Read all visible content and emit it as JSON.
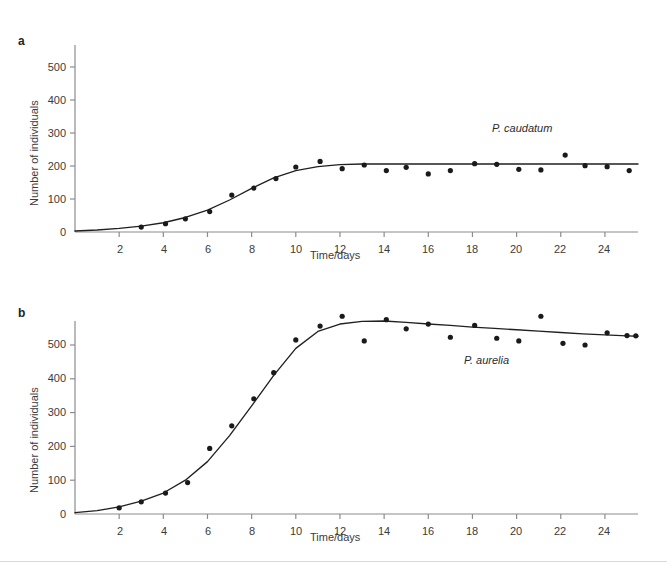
{
  "figure": {
    "panels": [
      {
        "key": "a",
        "label": "a",
        "series_label": "P. caudatum"
      },
      {
        "key": "b",
        "label": "b",
        "series_label": "P. aurelia"
      }
    ]
  },
  "chart_data": [
    {
      "type": "scatter",
      "panel": "a",
      "title": "",
      "series_label": "P. caudatum",
      "xlabel": "Time/days",
      "ylabel": "Number of individuals",
      "xlim": [
        0,
        25.5
      ],
      "ylim": [
        0,
        560
      ],
      "xticks": [
        2,
        4,
        6,
        8,
        10,
        12,
        14,
        16,
        18,
        20,
        22,
        24
      ],
      "yticks": [
        0,
        100,
        200,
        300,
        400,
        500
      ],
      "grid": false,
      "legend": "none",
      "x": [
        3.0,
        4.1,
        5.0,
        6.1,
        7.1,
        8.1,
        9.1,
        10.0,
        11.1,
        12.1,
        13.1,
        14.1,
        15.0,
        16.0,
        17.0,
        18.1,
        19.1,
        20.1,
        21.1,
        22.2,
        23.1,
        24.1,
        25.1
      ],
      "values": [
        15,
        25,
        40,
        62,
        112,
        133,
        162,
        197,
        214,
        192,
        203,
        186,
        196,
        176,
        186,
        207,
        205,
        190,
        188,
        233,
        201,
        198,
        186
      ],
      "series": [
        {
          "name": "P. caudatum observed counts",
          "x": [
            3.0,
            4.1,
            5.0,
            6.1,
            7.1,
            8.1,
            9.1,
            10.0,
            11.1,
            12.1,
            13.1,
            14.1,
            15.0,
            16.0,
            17.0,
            18.1,
            19.1,
            20.1,
            21.1,
            22.2,
            23.1,
            24.1,
            25.1
          ],
          "values": [
            15,
            25,
            40,
            62,
            112,
            133,
            162,
            197,
            214,
            192,
            203,
            186,
            196,
            176,
            186,
            207,
            205,
            190,
            188,
            233,
            201,
            198,
            186
          ]
        },
        {
          "name": "P. caudatum logistic fit",
          "x": [
            0,
            1,
            2,
            3,
            4,
            5,
            6,
            7,
            8,
            9,
            10,
            11,
            12,
            13,
            14,
            15,
            16,
            17,
            18,
            19,
            20,
            21,
            22,
            23,
            24,
            25,
            25.5
          ],
          "values": [
            3,
            6,
            11,
            18,
            28,
            44,
            66,
            97,
            132,
            164,
            186,
            198,
            204,
            206,
            206,
            206,
            206,
            206,
            206,
            206,
            206,
            206,
            206,
            206,
            206,
            206,
            206
          ]
        }
      ]
    },
    {
      "type": "scatter",
      "panel": "b",
      "title": "",
      "series_label": "P. aurelia",
      "xlabel": "Time/days",
      "ylabel": "Number of individuals",
      "xlim": [
        0,
        25.5
      ],
      "ylim": [
        0,
        560
      ],
      "xticks": [
        2,
        4,
        6,
        8,
        10,
        12,
        14,
        16,
        18,
        20,
        22,
        24
      ],
      "yticks": [
        0,
        100,
        200,
        300,
        400,
        500
      ],
      "grid": false,
      "legend": "none",
      "x": [
        2.0,
        3.0,
        4.1,
        5.1,
        6.1,
        7.1,
        8.1,
        9.0,
        10.0,
        11.1,
        12.1,
        13.1,
        14.1,
        15.0,
        16.0,
        17.0,
        18.1,
        19.1,
        20.1,
        21.1,
        22.1,
        23.1,
        24.1,
        25.0,
        25.4
      ],
      "values": [
        18,
        36,
        62,
        93,
        194,
        261,
        341,
        418,
        515,
        556,
        585,
        512,
        575,
        548,
        562,
        523,
        558,
        520,
        512,
        585,
        505,
        500,
        536,
        528,
        527
      ],
      "series": [
        {
          "name": "P. aurelia observed counts",
          "x": [
            2.0,
            3.0,
            4.1,
            5.1,
            6.1,
            7.1,
            8.1,
            9.0,
            10.0,
            11.1,
            12.1,
            13.1,
            14.1,
            15.0,
            16.0,
            17.0,
            18.1,
            19.1,
            20.1,
            21.1,
            22.1,
            23.1,
            24.1,
            25.0,
            25.4
          ],
          "values": [
            18,
            36,
            62,
            93,
            194,
            261,
            341,
            418,
            515,
            556,
            585,
            512,
            575,
            548,
            562,
            523,
            558,
            520,
            512,
            585,
            505,
            500,
            536,
            528,
            527
          ]
        },
        {
          "name": "P. aurelia fitted curve",
          "x": [
            0,
            1,
            2,
            3,
            4,
            5,
            6,
            7,
            8,
            9,
            10,
            11,
            12,
            13,
            14,
            15,
            16,
            17,
            18,
            19,
            20,
            21,
            22,
            23,
            24,
            25,
            25.5
          ],
          "values": [
            4,
            10,
            21,
            38,
            62,
            100,
            155,
            232,
            320,
            410,
            490,
            540,
            562,
            570,
            571,
            567,
            562,
            558,
            553,
            549,
            545,
            541,
            537,
            533,
            530,
            527,
            526
          ]
        }
      ]
    }
  ],
  "axes": {
    "ylabel": "Number of individuals",
    "xlabel": "Time/days",
    "ytick_labels": [
      "0",
      "100",
      "200",
      "300",
      "400",
      "500"
    ],
    "xtick_labels": [
      "2",
      "4",
      "6",
      "8",
      "10",
      "12",
      "14",
      "16",
      "18",
      "20",
      "22",
      "24"
    ]
  },
  "colors": {
    "ink": "#231f20",
    "axis": "#8c8c8c",
    "curve": "#231f20",
    "marker": "#1a1a1a",
    "tick_text": "#3b3b3b",
    "rule": "#d9d9d9"
  }
}
